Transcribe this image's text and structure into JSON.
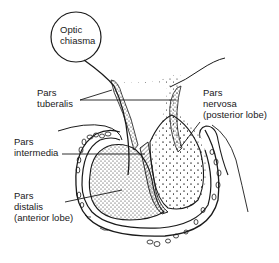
{
  "diagram": {
    "labels": {
      "optic_chiasma": "Optic\nchiasma",
      "pars_tuberalis": "Pars\ntuberalis",
      "pars_nervosa": "Pars\nnervosa\n(posterior lobe)",
      "pars_intermedia": "Pars\nintermedia",
      "pars_distalis": "Pars\ndistalis\n(anterior lobe)"
    },
    "colors": {
      "ink": "#1a1a1a",
      "background": "#ffffff"
    }
  }
}
